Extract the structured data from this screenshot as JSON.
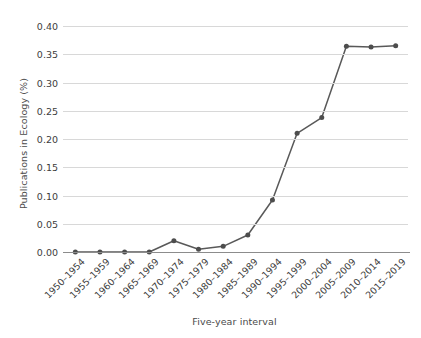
{
  "chart_data": {
    "type": "line",
    "title": "",
    "xlabel": "Five-year interval",
    "ylabel": "Publications in Ecology (%)",
    "categories": [
      "1950–1954",
      "1955–1959",
      "1960–1964",
      "1965–1969",
      "1970–1974",
      "1975–1979",
      "1980–1984",
      "1985–1989",
      "1990–1994",
      "1995–1999",
      "2000–2004",
      "2005–2009",
      "2010–2014",
      "2015–2019"
    ],
    "values": [
      0.0,
      0.0,
      0.0,
      0.0,
      0.02,
      0.005,
      0.01,
      0.03,
      0.092,
      0.21,
      0.238,
      0.364,
      0.363,
      0.365
    ],
    "ylim": [
      0.0,
      0.4
    ],
    "yticks": [
      "0.00",
      "0.05",
      "0.10",
      "0.15",
      "0.20",
      "0.25",
      "0.30",
      "0.35",
      "0.40"
    ],
    "ytick_values": [
      0.0,
      0.05,
      0.1,
      0.15,
      0.2,
      0.25,
      0.3,
      0.35,
      0.4
    ],
    "grid": true,
    "legend": "none",
    "line_color": "#595959",
    "marker_color": "#4d4d4d",
    "grid_color": "#d8d8d8",
    "axis_color": "#8c8c8c",
    "background": "#ffffff"
  }
}
